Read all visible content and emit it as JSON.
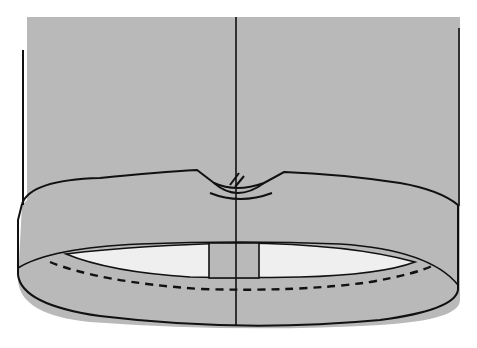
{
  "figure": {
    "type": "technical sewing illustration",
    "colors": {
      "background": "#ffffff",
      "fabric": "#b9b9b9",
      "lining": "#efefef",
      "ink": "#111111"
    },
    "elements": [
      {
        "name": "garment-body",
        "description": "gray fabric panel"
      },
      {
        "name": "left-side-edge-line",
        "description": "vertical line along left edge"
      },
      {
        "name": "right-side-edge-line",
        "description": "vertical line along right edge"
      },
      {
        "name": "center-line",
        "description": "vertical center line through whole figure"
      },
      {
        "name": "waistband",
        "description": "band around bottom of garment"
      },
      {
        "name": "notch",
        "description": "V-notch with clip marks at top of band center"
      },
      {
        "name": "inner-opening",
        "description": "white inner ellipse showing interior"
      },
      {
        "name": "facing-tab",
        "description": "rectangular tab at center of inner opening"
      },
      {
        "name": "stitch-line",
        "description": "dashed stitching line along inner band"
      }
    ]
  }
}
